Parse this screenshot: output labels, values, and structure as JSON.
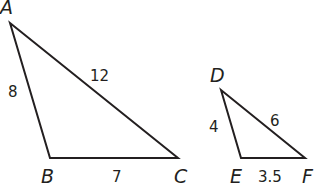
{
  "triangles": [
    {
      "name": "ABC",
      "vertices": {
        "A": "A",
        "B": "B",
        "C": "C"
      },
      "sides": {
        "AB": "8",
        "AC": "12",
        "BC": "7"
      }
    },
    {
      "name": "DEF",
      "vertices": {
        "D": "D",
        "E": "E",
        "F": "F"
      },
      "sides": {
        "DE": "4",
        "DF": "6",
        "EF": "3.5"
      }
    }
  ],
  "colors": {
    "stroke": "#231f20",
    "background": "#ffffff"
  }
}
